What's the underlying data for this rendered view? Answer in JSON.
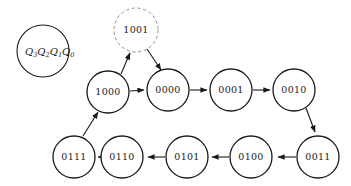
{
  "figure": {
    "kind": "state-transition-diagram",
    "background_color": "#ffffff",
    "stroke_color": "#1a1a1a",
    "dashed_stroke_color": "#8c8c8c"
  },
  "legend": {
    "name": "state-bit-order-legend",
    "q3": "Q",
    "q3_sub": "3",
    "q2": "Q",
    "q2_sub": "2",
    "q1": "Q",
    "q1_sub": "1",
    "q0": "Q",
    "q0_sub": "0"
  },
  "states": [
    {
      "id": "s1001",
      "label": "1001",
      "cx": 136,
      "cy": 30,
      "r": 22,
      "style": "dashed"
    },
    {
      "id": "s1000",
      "label": "1000",
      "cx": 108,
      "cy": 92,
      "r": 21,
      "style": "solid"
    },
    {
      "id": "s0000",
      "label": "0000",
      "cx": 168,
      "cy": 90,
      "r": 21,
      "style": "solid"
    },
    {
      "id": "s0001",
      "label": "0001",
      "cx": 231,
      "cy": 90,
      "r": 21,
      "style": "solid"
    },
    {
      "id": "s0010",
      "label": "0010",
      "cx": 294,
      "cy": 90,
      "r": 21,
      "style": "solid"
    },
    {
      "id": "s0011",
      "label": "0011",
      "cx": 318,
      "cy": 157,
      "r": 21,
      "style": "solid"
    },
    {
      "id": "s0100",
      "label": "0100",
      "cx": 251,
      "cy": 157,
      "r": 21,
      "style": "solid"
    },
    {
      "id": "s0101",
      "label": "0101",
      "cx": 187,
      "cy": 157,
      "r": 21,
      "style": "solid"
    },
    {
      "id": "s0110",
      "label": "0110",
      "cx": 122,
      "cy": 157,
      "r": 21,
      "style": "solid"
    },
    {
      "id": "s0111",
      "label": "0111",
      "cx": 74,
      "cy": 157,
      "r": 21,
      "style": "solid"
    }
  ],
  "transitions": [
    {
      "id": "t-1000-1001",
      "from": "1000",
      "to": "1001",
      "shape": "diagonal"
    },
    {
      "id": "t-1001-0000",
      "from": "1001",
      "to": "0000",
      "shape": "diagonal"
    },
    {
      "id": "t-1000-0000",
      "from": "1000",
      "to": "0000",
      "shape": "horizontal"
    },
    {
      "id": "t-0000-0001",
      "from": "0000",
      "to": "0001",
      "shape": "horizontal"
    },
    {
      "id": "t-0001-0010",
      "from": "0001",
      "to": "0010",
      "shape": "horizontal"
    },
    {
      "id": "t-0010-0011",
      "from": "0010",
      "to": "0011",
      "shape": "diagonal"
    },
    {
      "id": "t-0011-0100",
      "from": "0011",
      "to": "0100",
      "shape": "horizontal"
    },
    {
      "id": "t-0100-0101",
      "from": "0100",
      "to": "0101",
      "shape": "horizontal"
    },
    {
      "id": "t-0101-0110",
      "from": "0101",
      "to": "0110",
      "shape": "horizontal"
    },
    {
      "id": "t-0110-0111",
      "from": "0110",
      "to": "0111",
      "shape": "horizontal"
    },
    {
      "id": "t-0111-1000",
      "from": "0111",
      "to": "1000",
      "shape": "diagonal"
    }
  ]
}
